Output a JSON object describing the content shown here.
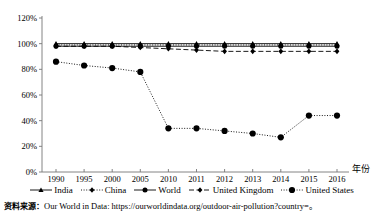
{
  "chart_data": {
    "type": "line",
    "title": "",
    "xlabel": "年份",
    "ylabel": "",
    "categories": [
      "1990",
      "1995",
      "2000",
      "2005",
      "2010",
      "2011",
      "2012",
      "2013",
      "2014",
      "2015",
      "2016"
    ],
    "ylim": [
      0,
      120
    ],
    "ytick_labels": [
      "0%",
      "20%",
      "40%",
      "60%",
      "80%",
      "100%",
      "120%"
    ],
    "ytick_values": [
      0,
      20,
      40,
      60,
      80,
      100,
      120
    ],
    "grid": false,
    "legend_position": "bottom",
    "series": [
      {
        "name": "India",
        "marker": "triangle",
        "line_style": "solid",
        "values": [
          100,
          100,
          100,
          100,
          100,
          100,
          100,
          100,
          100,
          100,
          100
        ]
      },
      {
        "name": "China",
        "marker": "diamond",
        "line_style": "dotted",
        "values": [
          99,
          99,
          99,
          99,
          99,
          99,
          99,
          99,
          99,
          99,
          99
        ]
      },
      {
        "name": "World",
        "marker": "circle",
        "line_style": "solid",
        "values": [
          98,
          98,
          98,
          98,
          98,
          98,
          98,
          98,
          98,
          98,
          98
        ]
      },
      {
        "name": "United Kingdom",
        "marker": "diamond",
        "line_style": "dashed",
        "values": [
          98,
          98,
          98,
          97,
          96,
          95,
          94,
          94,
          94,
          94,
          94
        ]
      },
      {
        "name": "United States",
        "marker": "circle-large",
        "line_style": "dotted",
        "values": [
          86,
          83,
          81,
          78,
          34,
          34,
          32,
          30,
          27,
          44,
          44
        ]
      }
    ]
  },
  "axis": {
    "x_name": "年份"
  },
  "source": {
    "label": "资料来源：",
    "text": "Our World in Data: https://ourworldindata.org/outdoor-air-pollution?country=。"
  }
}
